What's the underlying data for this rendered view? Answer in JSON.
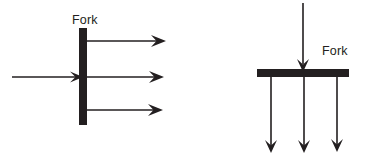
{
  "diagram": {
    "stroke_color": "#231f20",
    "background_color": "#ffffff",
    "bar_color": "#231f20",
    "panels": [
      {
        "id": "vertical-fork",
        "orientation": "vertical-bar",
        "label": "Fork",
        "label_x": 72,
        "label_y": 24,
        "bar": {
          "x": 79,
          "y": 28,
          "width": 8,
          "height": 97
        },
        "incoming_arrows": [
          {
            "x1": 12,
            "y1": 77,
            "x2": 84,
            "y2": 77,
            "direction": "right"
          }
        ],
        "outgoing_arrows": [
          {
            "x1": 87,
            "y1": 41,
            "x2": 166,
            "y2": 41,
            "direction": "right"
          },
          {
            "x1": 87,
            "y1": 77,
            "x2": 164,
            "y2": 77,
            "direction": "right"
          },
          {
            "x1": 87,
            "y1": 110,
            "x2": 163,
            "y2": 110,
            "direction": "right"
          }
        ]
      },
      {
        "id": "horizontal-fork",
        "orientation": "horizontal-bar",
        "label": "Fork",
        "label_x": 322,
        "label_y": 55,
        "bar": {
          "x": 257,
          "y": 69,
          "width": 92,
          "height": 8
        },
        "incoming_arrows": [
          {
            "x1": 303,
            "y1": 3,
            "x2": 303,
            "y2": 72,
            "direction": "down"
          }
        ],
        "outgoing_arrows": [
          {
            "x1": 271,
            "y1": 77,
            "x2": 271,
            "y2": 153,
            "direction": "down"
          },
          {
            "x1": 304,
            "y1": 77,
            "x2": 304,
            "y2": 153,
            "direction": "down"
          },
          {
            "x1": 337,
            "y1": 77,
            "x2": 337,
            "y2": 152,
            "direction": "down"
          }
        ]
      }
    ]
  }
}
